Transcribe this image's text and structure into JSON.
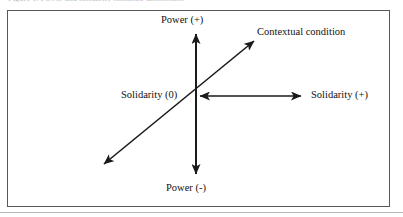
{
  "figure": {
    "caption_sliver": "Figure 1. Power and solidarity semantic dimensions",
    "background_color": "#ffffff",
    "frame_color": "#58585a",
    "line_color": "#1a1a1a"
  },
  "diagram": {
    "type": "axis-diagram",
    "center": {
      "x": 196,
      "y": 96,
      "label": "Solidarity (0)"
    },
    "axes": [
      {
        "name": "vertical-axis",
        "orientation": "vertical",
        "arrowheads": "both",
        "positive_label": "Power (+)",
        "negative_label": "Power (-)",
        "from": {
          "x": 196,
          "y": 178
        },
        "to": {
          "x": 196,
          "y": 30
        }
      },
      {
        "name": "horizontal-axis",
        "orientation": "horizontal",
        "arrowheads": "both",
        "origin_label": "Solidarity (0)",
        "positive_label": "Solidarity (+)",
        "from": {
          "x": 196,
          "y": 96
        },
        "to": {
          "x": 305,
          "y": 96
        }
      },
      {
        "name": "diagonal-axis",
        "orientation": "diagonal",
        "arrowheads": "both",
        "label": "Contextual condition",
        "from": {
          "x": 100,
          "y": 168
        },
        "to": {
          "x": 258,
          "y": 37
        }
      }
    ],
    "labels": {
      "power_positive": "Power (+)",
      "power_negative": "Power (-)",
      "solidarity_zero": "Solidarity (0)",
      "solidarity_positive": "Solidarity (+)",
      "contextual_condition": "Contextual condition"
    }
  }
}
